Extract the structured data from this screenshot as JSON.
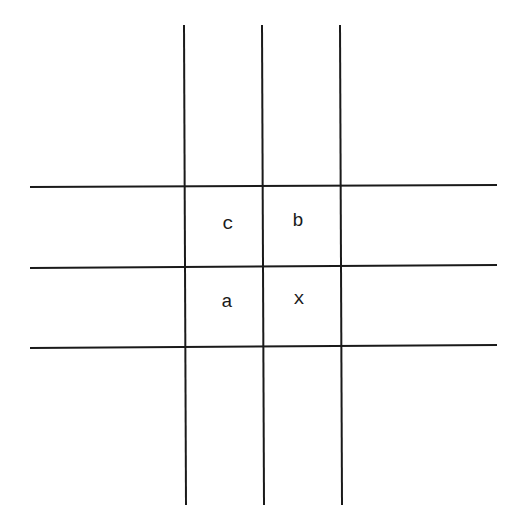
{
  "diagram": {
    "type": "grid",
    "line_color": "#1a1a1a",
    "vertical_lines": [
      {
        "x1": 184,
        "y1": 25,
        "x2": 186,
        "y2": 505
      },
      {
        "x1": 262,
        "y1": 25,
        "x2": 264,
        "y2": 505
      },
      {
        "x1": 340,
        "y1": 25,
        "x2": 342,
        "y2": 505
      }
    ],
    "horizontal_lines": [
      {
        "x1": 30,
        "y1": 187,
        "x2": 497,
        "y2": 185
      },
      {
        "x1": 30,
        "y1": 268,
        "x2": 497,
        "y2": 265
      },
      {
        "x1": 30,
        "y1": 348,
        "x2": 497,
        "y2": 345
      }
    ],
    "cells": [
      {
        "label": "c",
        "row": 0,
        "col": 0
      },
      {
        "label": "b",
        "row": 0,
        "col": 1
      },
      {
        "label": "a",
        "row": 1,
        "col": 0
      },
      {
        "label": "x",
        "row": 1,
        "col": 1
      }
    ]
  }
}
